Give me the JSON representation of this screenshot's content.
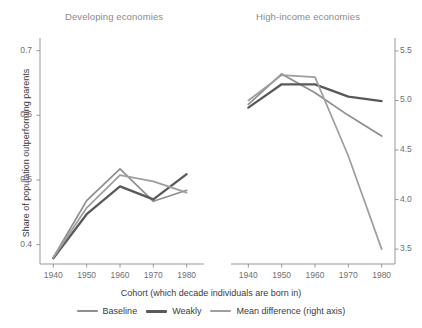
{
  "chart_data": {
    "type": "line",
    "title": "",
    "xlabel": "Cohort (which decade individuals are born in)",
    "ylabel": "Share of population outperforming parents",
    "ylabel_right": "",
    "x": [
      1940,
      1950,
      1960,
      1970,
      1980
    ],
    "xlim": [
      1936,
      1984
    ],
    "ylim": [
      0.37,
      0.715
    ],
    "ylim_right": [
      3.35,
      5.6
    ],
    "grid": false,
    "legend_position": "bottom",
    "xticks": [
      "1940",
      "1950",
      "1960",
      "1970",
      "1980"
    ],
    "yticks_left": [
      "0.4",
      "0.5",
      "0.6",
      "0.7"
    ],
    "yticks_right": [
      "3.5",
      "4.0",
      "4.5",
      "5.0",
      "5.5"
    ],
    "ytick_values_left": [
      0.4,
      0.5,
      0.6,
      0.7
    ],
    "ytick_values_right": [
      3.5,
      4.0,
      4.5,
      5.0,
      5.5
    ],
    "panels": [
      {
        "name": "developing",
        "title": "Developing economies",
        "series": [
          {
            "name": "Baseline",
            "axis": "left",
            "color": "#8e8e8e",
            "values": [
              0.38,
              0.468,
              0.517,
              0.467,
              0.484
            ]
          },
          {
            "name": "Weakly",
            "axis": "left",
            "color": "#595959",
            "values": [
              0.379,
              0.447,
              0.49,
              0.47,
              0.509
            ]
          },
          {
            "name": "Mean difference (right axis)",
            "axis": "right",
            "color": "#9e9e9e",
            "values": [
              3.415,
              3.917,
              4.246,
              4.184,
              4.07
            ]
          }
        ]
      },
      {
        "name": "high-income",
        "title": "High-income economies",
        "series": [
          {
            "name": "Baseline",
            "axis": "left",
            "color": "#8e8e8e",
            "values": [
              0.617,
              0.664,
              0.635,
              0.6,
              0.568
            ]
          },
          {
            "name": "Weakly",
            "axis": "left",
            "color": "#595959",
            "values": [
              0.612,
              0.648,
              0.648,
              0.629,
              0.622
            ]
          },
          {
            "name": "Mean difference (right axis)",
            "axis": "right",
            "color": "#9e9e9e",
            "values": [
              5.0,
              5.255,
              5.235,
              4.44,
              3.5
            ]
          }
        ]
      }
    ],
    "legend": [
      {
        "label": "Baseline",
        "color": "#8e8e8e"
      },
      {
        "label": "Weakly",
        "color": "#595959"
      },
      {
        "label": "Mean difference (right axis)",
        "color": "#9e9e9e"
      }
    ]
  }
}
